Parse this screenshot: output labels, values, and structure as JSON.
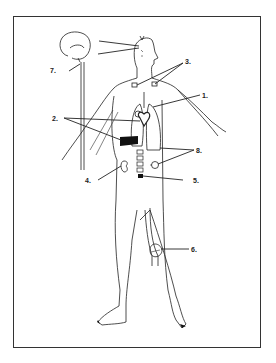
{
  "diagram": {
    "type": "anatomical-body-outline",
    "labels": [
      {
        "id": "1",
        "text": "1."
      },
      {
        "id": "2",
        "text": "2."
      },
      {
        "id": "3",
        "text": "3."
      },
      {
        "id": "4",
        "text": "4."
      },
      {
        "id": "5",
        "text": "5."
      },
      {
        "id": "6",
        "text": "6."
      },
      {
        "id": "7",
        "text": "7."
      },
      {
        "id": "8",
        "text": "8."
      }
    ],
    "colors": {
      "ink": "#222222",
      "frame": "#333333",
      "background": "#ffffff"
    }
  }
}
